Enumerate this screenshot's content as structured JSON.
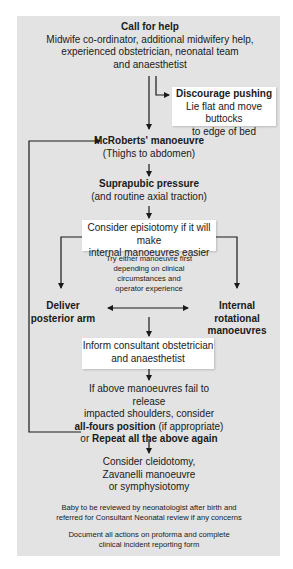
{
  "flowchart": {
    "call_for_help": {
      "title": "Call for help",
      "line1": "Midwife co-ordinator, additional midwifery help,",
      "line2": "experienced obstetrician, neonatal team",
      "line3": "and anaesthetist"
    },
    "discourage_pushing": {
      "title": "Discourage pushing",
      "line1": "Lie flat and move buttocks",
      "line2": "to edge of bed"
    },
    "mcroberts": {
      "title": "McRoberts' manoeuvre",
      "subtitle": "(Thighs to abdomen)"
    },
    "suprapubic": {
      "title": "Suprapubic pressure",
      "subtitle": "(and routine axial traction)"
    },
    "episiotomy": {
      "line1": "Consider episiotomy if it will make",
      "line2": "internal manoeuvres easier"
    },
    "try_either": {
      "line1": "Try either manoeuvre first",
      "line2": "depending on clinical",
      "line3": "circumstances and",
      "line4": "operator experience"
    },
    "posterior_arm": {
      "line1": "Deliver",
      "line2": "posterior arm"
    },
    "internal_rotational": {
      "line1": "Internal rotational",
      "line2": "manoeuvres"
    },
    "inform_consultant": {
      "line1": "Inform consultant obstetrician",
      "line2": "and anaesthetist"
    },
    "if_fail": {
      "line1": "If above manoeuvres fail to release",
      "line2": "impacted shoulders, consider",
      "line3_bold": "all-fours position",
      "line3_rest": " (if appropriate)",
      "line4_pre": "or ",
      "line4_bold": "Repeat all the above again"
    },
    "final_options": {
      "line1": "Consider cleidotomy,",
      "line2": "Zavanelli manoeuvre",
      "line3": "or symphysiotomy"
    },
    "baby_review": {
      "line1": "Baby to be reviewed by neonatologist after birth and",
      "line2": "referred for Consultant Neonatal review if any concerns"
    },
    "document": {
      "line1": "Document all actions on proforma and complete",
      "line2": "clinical incident reporting form"
    }
  },
  "colors": {
    "panel": "#e3e3e3",
    "box": "#ffffff",
    "line": "#1a1a1a"
  }
}
